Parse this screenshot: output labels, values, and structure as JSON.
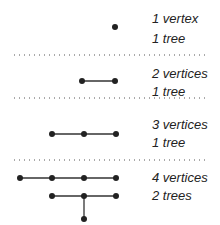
{
  "rows": [
    {
      "line1": "1 vertex",
      "line2": "1 tree"
    },
    {
      "line1": "2 vertices",
      "line2": "1 tree"
    },
    {
      "line1": "3 vertices",
      "line2": "1 tree"
    },
    {
      "line1": "4 vertices",
      "line2": "2 trees"
    }
  ],
  "colors": {
    "ink": "#222222",
    "dots": "#555555"
  }
}
